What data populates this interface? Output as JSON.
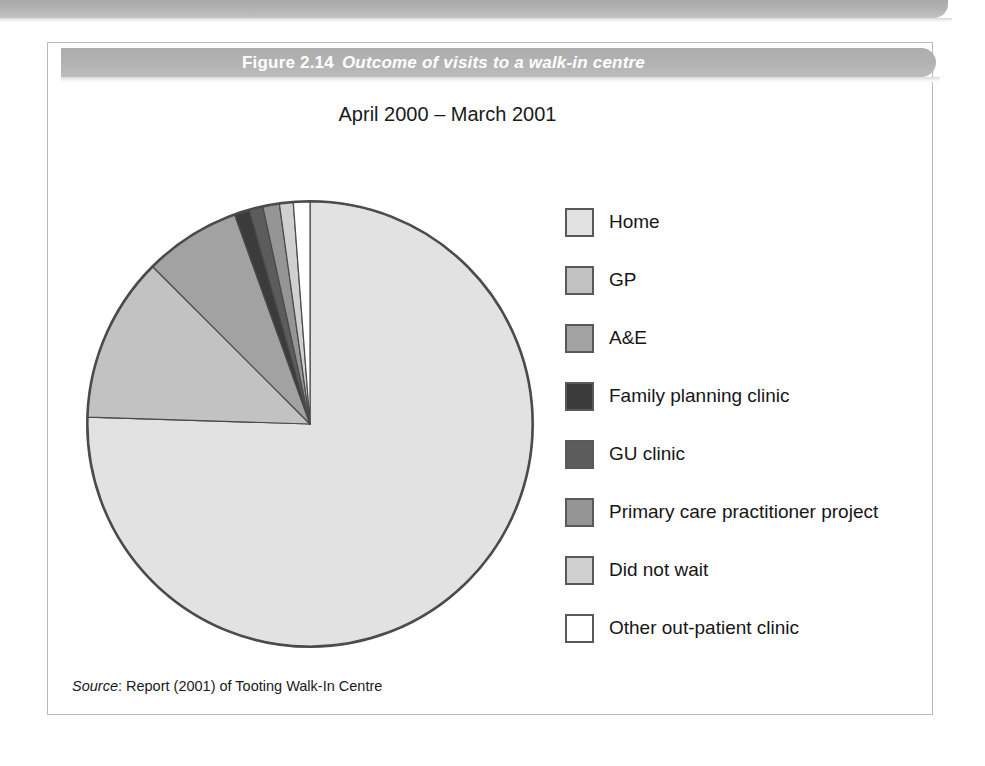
{
  "figure": {
    "number": "Figure 2.14",
    "caption": "Outcome of visits to a walk-in centre",
    "subtitle": "April 2000 – March 2001",
    "source_word": "Source",
    "source_text": ": Report (2001) of Tooting Walk-In Centre"
  },
  "chart_data": {
    "type": "pie",
    "title": "Outcome of visits to a walk-in centre",
    "subtitle": "April 2000 – March 2001",
    "legend_position": "right",
    "start_angle": 0,
    "direction": "clockwise",
    "categories": [
      "Home",
      "GP",
      "A&E",
      "Family planning clinic",
      "GU clinic",
      "Primary care practitioner project",
      "Did not wait",
      "Other out-patient clinic"
    ],
    "values": [
      75.5,
      12.0,
      7.0,
      1.1,
      1.0,
      1.2,
      1.0,
      1.2
    ],
    "colors": [
      "#e2e2e2",
      "#c2c2c2",
      "#a2a2a2",
      "#3b3b3b",
      "#5c5c5c",
      "#959595",
      "#d0d0d0",
      "#ffffff"
    ],
    "slice_border": "#4a4a4a",
    "units": "percent"
  },
  "legend": {
    "items": [
      {
        "label": "Home",
        "color": "#e2e2e2"
      },
      {
        "label": "GP",
        "color": "#c2c2c2"
      },
      {
        "label": "A&E",
        "color": "#a2a2a2"
      },
      {
        "label": "Family planning clinic",
        "color": "#3b3b3b"
      },
      {
        "label": "GU clinic",
        "color": "#5c5c5c"
      },
      {
        "label": "Primary care practitioner project",
        "color": "#959595"
      },
      {
        "label": "Did not wait",
        "color": "#d0d0d0"
      },
      {
        "label": "Other out-patient clinic",
        "color": "#ffffff"
      }
    ]
  }
}
